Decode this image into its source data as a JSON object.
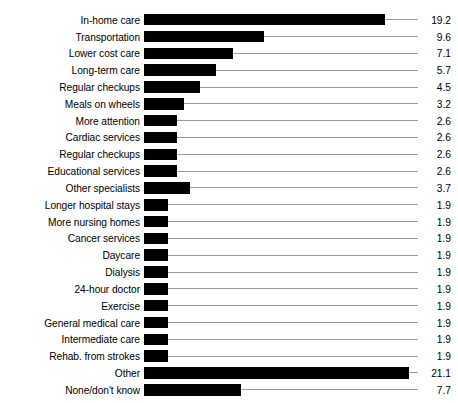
{
  "chart_data": {
    "type": "bar",
    "orientation": "horizontal",
    "title": "",
    "subtitle": "",
    "xlabel": "",
    "ylabel": "",
    "grid": false,
    "legend": null,
    "axis_visible": false,
    "value_labels_shown": true,
    "xlim": [
      0,
      21.1
    ],
    "categories": [
      "In-home care",
      "Transportation",
      "Lower cost care",
      "Long-term care",
      "Regular checkups",
      "Meals on wheels",
      "More attention",
      "Cardiac services",
      "Regular checkups",
      "Educational services",
      "Other specialists",
      "Longer hospital stays",
      "More nursing homes",
      "Cancer services",
      "Daycare",
      "Dialysis",
      "24-hour doctor",
      "Exercise",
      "General medical care",
      "Intermediate care",
      "Rehab. from strokes",
      "Other",
      "None/don't know"
    ],
    "values": [
      19.2,
      9.6,
      7.1,
      5.7,
      4.5,
      3.2,
      2.6,
      2.6,
      2.6,
      2.6,
      3.7,
      1.9,
      1.9,
      1.9,
      1.9,
      1.9,
      1.9,
      1.9,
      1.9,
      1.9,
      1.9,
      21.1,
      7.7
    ],
    "value_labels": [
      "19.2",
      "9.6",
      "7.1",
      "5.7",
      "4.5",
      "3.2",
      "2.6",
      "2.6",
      "2.6",
      "2.6",
      "3.7",
      "1.9",
      "1.9",
      "1.9",
      "1.9",
      "1.9",
      "1.9",
      "1.9",
      "1.9",
      "1.9",
      "1.9",
      "21.1",
      "7.7"
    ],
    "colors": {
      "bar": "#000000",
      "leader_line": "#9a9a9a",
      "background": "#ffffff",
      "text": "#000000"
    }
  }
}
